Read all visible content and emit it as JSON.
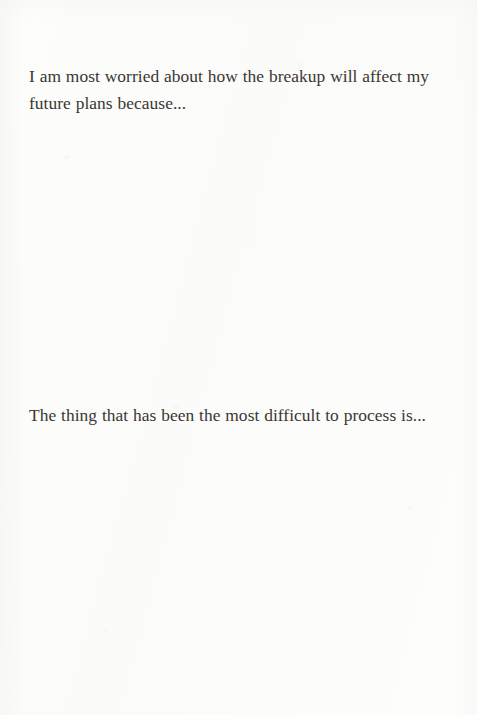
{
  "page": {
    "type": "journal-prompt-page",
    "background_color": "#fcfcfb",
    "text_color": "#3a3733",
    "width": 477,
    "height": 715
  },
  "prompts": [
    {
      "id": "prompt-future-plans",
      "text": "I am most worried about how the breakup will affect my future plans because...",
      "answer_space": true
    },
    {
      "id": "prompt-difficult-to-process",
      "text": "The thing that has been the most difficult to process is...",
      "answer_space": true
    }
  ]
}
